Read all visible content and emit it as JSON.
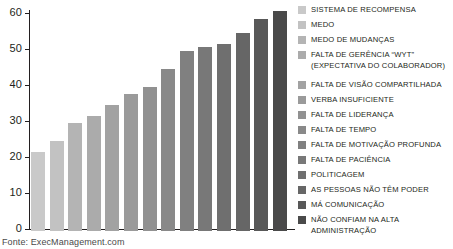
{
  "chart_data": {
    "type": "bar",
    "title": "",
    "subtitle": "",
    "xlabel": "",
    "ylabel": "",
    "ylim": [
      0,
      60
    ],
    "yticks": [
      0,
      10,
      20,
      30,
      40,
      50,
      60
    ],
    "grid": false,
    "legend_position": "right",
    "source": "Fonte: ExecManagement.com",
    "categories": [
      "SISTEMA DE RECOMPENSA",
      "MEDO",
      "MEDO DE MUDANÇAS",
      "FALTA DE GERÊNCIA “WYT”\n(EXPECTATIVA DO COLABORADOR)",
      "FALTA DE VISÃO COMPARTILHADA",
      "VERBA INSUFICIENTE",
      "FALTA DE LIDERANÇA",
      "FALTA DE TEMPO",
      "FALTA DE MOTIVAÇÃO PROFUNDA",
      "FALTA DE PACIÊNCIA",
      "POLITICAGEM",
      "AS PESSOAS NÃO TÊM PODER",
      "MÁ COMUNICAÇÃO",
      "NÃO CONFIAM NA ALTA\nADMINISTRAÇÃO"
    ],
    "values": [
      22,
      25,
      30,
      32,
      35,
      38,
      40,
      45,
      50,
      51,
      52,
      55,
      59,
      61
    ],
    "colors": [
      "#c9c9c9",
      "#c2c2c2",
      "#b4b4b4",
      "#ababab",
      "#a2a2a2",
      "#9a9a9a",
      "#919191",
      "#898989",
      "#808080",
      "#787878",
      "#6f6f6f",
      "#666666",
      "#585858",
      "#4a4a4a"
    ]
  }
}
